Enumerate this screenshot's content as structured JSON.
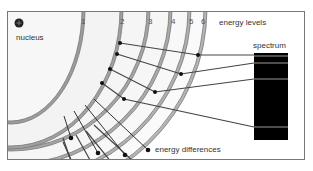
{
  "diagram": {
    "labels": {
      "nucleus": "nucleus",
      "energy_levels": "energy levels",
      "spectrum": "spectrum",
      "energy_differences": "energy differences"
    },
    "levels": [
      "1",
      "2",
      "3",
      "4",
      "5",
      "6"
    ],
    "spectrum_lines_count": 4,
    "colors": {
      "spectrum": "#000000",
      "rings": "#cccccc",
      "lines": "#444444"
    }
  }
}
